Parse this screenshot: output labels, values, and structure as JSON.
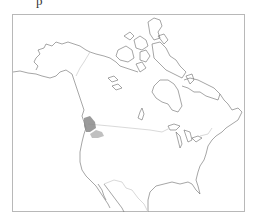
{
  "page": {
    "top_text_fragment": "p"
  },
  "map": {
    "region": "North America",
    "style": "outline",
    "colors": {
      "coastline": "#6a6a6a",
      "borders": "#cfcfcf",
      "frame": "#b8b8b8",
      "range_dark": "#8a8a8a",
      "range_light": "#b5b5b5"
    },
    "highlighted_ranges": [
      {
        "label": "coastal-pacific-northwest",
        "shade": "dark"
      },
      {
        "label": "inland-northwest",
        "shade": "light"
      }
    ]
  }
}
